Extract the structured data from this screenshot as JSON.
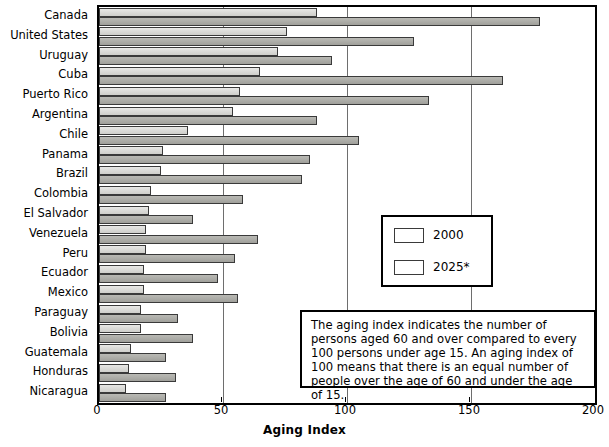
{
  "chart_data": {
    "type": "bar",
    "orientation": "horizontal",
    "title": "",
    "xlabel": "Aging Index",
    "ylabel": "",
    "xlim": [
      0,
      200
    ],
    "xticks": [
      0,
      50,
      100,
      150,
      200
    ],
    "xticklabels": [
      "0",
      "50",
      "100",
      "150",
      "200"
    ],
    "grid": "vertical",
    "legend_position": "center-right",
    "categories": [
      "Canada",
      "United States",
      "Uruguay",
      "Cuba",
      "Puerto Rico",
      "Argentina",
      "Chile",
      "Panama",
      "Brazil",
      "Colombia",
      "El Salvador",
      "Venezuela",
      "Peru",
      "Ecuador",
      "Mexico",
      "Paraguay",
      "Bolivia",
      "Guatemala",
      "Honduras",
      "Nicaragua"
    ],
    "series": [
      {
        "name": "2000",
        "color": "#dcdcd9",
        "values": [
          88,
          76,
          72,
          65,
          57,
          54,
          36,
          26,
          25,
          21,
          20,
          19,
          19,
          18,
          18,
          17,
          17,
          13,
          12,
          11
        ]
      },
      {
        "name": "2025*",
        "color": "#aeaea9",
        "values": [
          178,
          127,
          94,
          163,
          133,
          88,
          105,
          85,
          82,
          58,
          38,
          64,
          55,
          48,
          56,
          32,
          38,
          27,
          31,
          27
        ]
      }
    ],
    "annotation": "The aging index indicates the number of persons aged 60 and over compared to every 100 persons under age 15. An aging index of 100 means that there is an equal number of people over the age of 60 and under the age of 15."
  },
  "legend": {
    "items": [
      {
        "label": "2000"
      },
      {
        "label": "2025*"
      }
    ]
  }
}
